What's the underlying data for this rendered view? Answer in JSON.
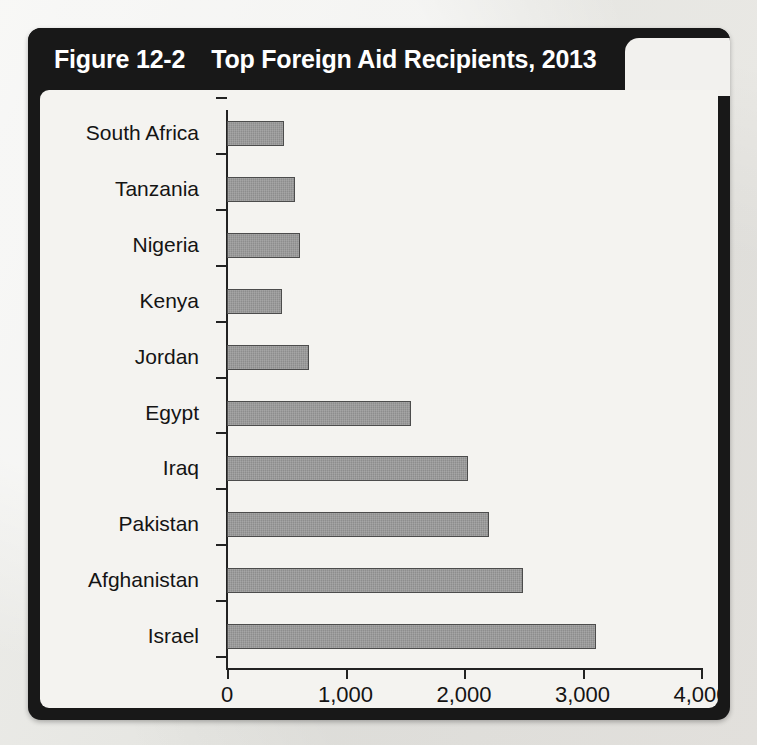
{
  "figure": {
    "number": "Figure 12-2",
    "title": "Top Foreign Aid Recipients, 2013"
  },
  "ghost_bleed_text": "Total Foreign Aid as a Percent of Gross National Income",
  "colors": {
    "frame": "#181818",
    "panel": "#f4f3f0",
    "bar_fill": "#8d8d8d",
    "bar_border": "#4c4c4c",
    "axis": "#222222",
    "title_text": "#ffffff"
  },
  "chart_data": {
    "type": "bar",
    "orientation": "horizontal",
    "title": "Top Foreign Aid Recipients, 2013",
    "xlabel": "Foreign Aid Received (in millions)",
    "ylabel": "",
    "xlim": [
      0,
      4000
    ],
    "xticks": [
      0,
      1000,
      2000,
      3000,
      4000
    ],
    "xtick_labels": [
      "0",
      "1,000",
      "2,000",
      "3,000",
      "4,000"
    ],
    "grid": false,
    "legend": false,
    "categories": [
      "South Africa",
      "Tanzania",
      "Nigeria",
      "Kenya",
      "Jordan",
      "Egypt",
      "Iraq",
      "Pakistan",
      "Afghanistan",
      "Israel"
    ],
    "values": [
      480,
      570,
      615,
      465,
      690,
      1550,
      2030,
      2210,
      2500,
      3110
    ]
  }
}
